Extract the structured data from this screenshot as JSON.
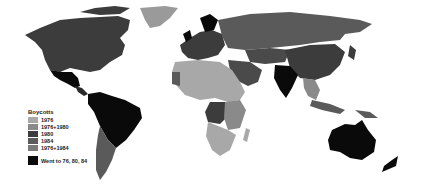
{
  "legend": {
    "title": "Boycotts",
    "items": [
      {
        "label": "1976",
        "color": "#a8a8a8"
      },
      {
        "label": "1976+1980",
        "color": "#8a8a8a"
      },
      {
        "label": "1980",
        "color": "#3c3c3c"
      },
      {
        "label": "1984",
        "color": "#5a5a5a"
      },
      {
        "label": "1976+1984",
        "color": "#7a7a7a"
      }
    ],
    "attended": {
      "label": "Went to 76, 80, 84",
      "color": "#0a0a0a"
    }
  },
  "colors": {
    "c1976": "#a8a8a8",
    "c1976_1980": "#8a8a8a",
    "c1980": "#3c3c3c",
    "c1984": "#5a5a5a",
    "c1976_1984": "#7a7a7a",
    "all": "#0a0a0a"
  }
}
